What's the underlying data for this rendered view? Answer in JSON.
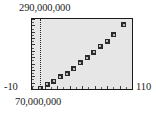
{
  "labels": {
    "y_max": "290,000,000",
    "y_min": "70,000,000",
    "x_min": "-10",
    "x_max": "110"
  },
  "colors": {
    "plot_background": "#e6e6e6",
    "frame": "#1a1a1a",
    "marker": "#2b2b2b",
    "gridline": "#2a2a2a",
    "page_background": "#ffffff",
    "text": "#1c1c1c"
  },
  "chart_data": {
    "type": "scatter",
    "title": "",
    "subtitle": "",
    "xlabel": "",
    "ylabel": "",
    "xlim": [
      -10,
      110
    ],
    "ylim": [
      70000000,
      290000000
    ],
    "x_tick_labels": [
      "-10",
      "110"
    ],
    "y_tick_labels": [
      "70,000,000",
      "290,000,000"
    ],
    "grid": false,
    "legend": null,
    "legend_position": "none",
    "annotations": [
      {
        "kind": "vertical-dotted-line",
        "x": 0,
        "note": "dotted vertical line at x = 0 just inside the left frame edge"
      }
    ],
    "series": [
      {
        "name": "series-1",
        "marker": "square",
        "x": [
          0,
          8,
          16,
          24,
          32,
          40,
          48,
          56,
          64,
          72,
          80,
          88,
          100
        ],
        "y": [
          72000000,
          85000000,
          95000000,
          108000000,
          118000000,
          134000000,
          152000000,
          168000000,
          186000000,
          204000000,
          220000000,
          240000000,
          272000000
        ],
        "points": [
          {
            "x": 0,
            "y": 72000000
          },
          {
            "x": 8,
            "y": 85000000
          },
          {
            "x": 16,
            "y": 95000000
          },
          {
            "x": 24,
            "y": 108000000
          },
          {
            "x": 32,
            "y": 118000000
          },
          {
            "x": 40,
            "y": 134000000
          },
          {
            "x": 48,
            "y": 152000000
          },
          {
            "x": 56,
            "y": 168000000
          },
          {
            "x": 64,
            "y": 186000000
          },
          {
            "x": 72,
            "y": 204000000
          },
          {
            "x": 80,
            "y": 220000000
          },
          {
            "x": 88,
            "y": 240000000
          },
          {
            "x": 100,
            "y": 272000000
          }
        ]
      }
    ]
  },
  "axis_ticks": {
    "x_minor_count": 16,
    "y_minor_count": 22
  }
}
